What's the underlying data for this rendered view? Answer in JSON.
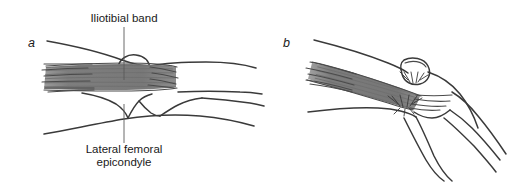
{
  "figure": {
    "background_color": "#ffffff",
    "line_color": "#3a3a3a",
    "band_fill_color": "#808080",
    "text_color": "#1a1a1a"
  },
  "panels": [
    {
      "letter": "a",
      "name": "panel-a-knee-extended",
      "labels": [
        {
          "name": "iliotibial-band-label",
          "text": "Iliotibial band",
          "lines": [
            "Iliotibial band"
          ],
          "position": "top",
          "leader": "vertical line from text down to the band"
        },
        {
          "name": "lateral-femoral-epicondyle-label",
          "text": "Lateral femoral epicondyle",
          "lines": [
            "Lateral femoral",
            "epicondyle"
          ],
          "position": "bottom",
          "leader": "vertical line from text up to the epicondyle"
        }
      ]
    },
    {
      "letter": "b",
      "name": "panel-b-knee-flexed",
      "labels": []
    }
  ],
  "annotations": {
    "friction_marks": [
      {
        "name": "friction-burst-upper",
        "panel": "b"
      },
      {
        "name": "friction-burst-lower",
        "panel": "b"
      }
    ]
  }
}
